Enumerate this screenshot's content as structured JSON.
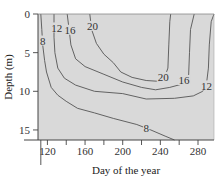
{
  "chart_data": {
    "type": "contour",
    "title": "",
    "xlabel": "Day of the year",
    "ylabel": "Depth (m)",
    "xlim": [
      110,
      297
    ],
    "ylim": [
      16.3,
      0
    ],
    "x_ticks": [
      120,
      140,
      160,
      180,
      200,
      220,
      240,
      260,
      280
    ],
    "x_tick_labels": [
      "120",
      "",
      "160",
      "",
      "200",
      "",
      "240",
      "",
      "280"
    ],
    "y_ticks": [
      0,
      5,
      10,
      15
    ],
    "y_tick_labels": [
      "0",
      "5",
      "10",
      "15"
    ],
    "grid": false,
    "background": "#d9d9d9",
    "line_color": "#555555",
    "contours": [
      {
        "level": 8,
        "label": "8",
        "points": [
          [
            113,
            0
          ],
          [
            114,
            2
          ],
          [
            115,
            4
          ],
          [
            117,
            6
          ],
          [
            119,
            7.5
          ],
          [
            124,
            9.5
          ],
          [
            131,
            10.5
          ],
          [
            140,
            11.3
          ],
          [
            152,
            12.2
          ],
          [
            170,
            12.8
          ],
          [
            190,
            13.5
          ],
          [
            215,
            14.3
          ],
          [
            230,
            15
          ],
          [
            245,
            15.8
          ],
          [
            255,
            16.3
          ]
        ]
      },
      {
        "level": 12,
        "label": "12",
        "points": [
          [
            127,
            0
          ],
          [
            127,
            3
          ],
          [
            128,
            5
          ],
          [
            131,
            7
          ],
          [
            138,
            8.3
          ],
          [
            150,
            9.2
          ],
          [
            170,
            10
          ],
          [
            200,
            10.3
          ],
          [
            225,
            11
          ],
          [
            255,
            10.9
          ],
          [
            275,
            10.6
          ],
          [
            285,
            10
          ],
          [
            289,
            9
          ],
          [
            291,
            7
          ],
          [
            292,
            4
          ],
          [
            294,
            1
          ],
          [
            298,
            0
          ]
        ]
      },
      {
        "level": 16,
        "label": "16",
        "points": [
          [
            141,
            0
          ],
          [
            143,
            2
          ],
          [
            145,
            4
          ],
          [
            150,
            5.8
          ],
          [
            160,
            6.8
          ],
          [
            180,
            7.8
          ],
          [
            200,
            8.8
          ],
          [
            220,
            9.5
          ],
          [
            235,
            9.8
          ],
          [
            250,
            9.5
          ],
          [
            265,
            9
          ],
          [
            270,
            8
          ],
          [
            271,
            5
          ],
          [
            272,
            2
          ],
          [
            276,
            0
          ]
        ]
      },
      {
        "level": 20,
        "label": "20",
        "points": [
          [
            165,
            0
          ],
          [
            167,
            2
          ],
          [
            172,
            3.8
          ],
          [
            180,
            5.2
          ],
          [
            190,
            6.3
          ],
          [
            198,
            7.5
          ],
          [
            210,
            8.2
          ],
          [
            225,
            8.6
          ],
          [
            238,
            8.7
          ],
          [
            244,
            8.4
          ],
          [
            248,
            7
          ],
          [
            249,
            4
          ],
          [
            250,
            1
          ],
          [
            251,
            0
          ]
        ]
      }
    ],
    "contour_labels": [
      {
        "text": "8",
        "x": 115,
        "y": 3.5
      },
      {
        "text": "12",
        "x": 130,
        "y": 1.8
      },
      {
        "text": "16",
        "x": 144,
        "y": 2.1
      },
      {
        "text": "20",
        "x": 168,
        "y": 1.6
      },
      {
        "text": "20",
        "x": 243,
        "y": 8.2
      },
      {
        "text": "16",
        "x": 265,
        "y": 8.6
      },
      {
        "text": "12",
        "x": 289,
        "y": 9.3
      },
      {
        "text": "8",
        "x": 225,
        "y": 14.8
      }
    ]
  }
}
